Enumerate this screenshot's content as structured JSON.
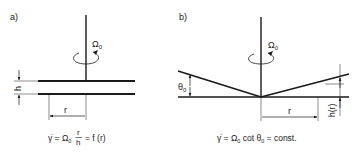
{
  "panel_a": {
    "label": "a)",
    "omega": "Ω",
    "omega_sub": "0",
    "h_label": "h",
    "r_label": "r",
    "formula": {
      "lhs": "γ̇ = Ω",
      "lhs_sub": "0",
      "frac_num": "r",
      "frac_den": "h",
      "rhs": "= f (r)"
    }
  },
  "panel_b": {
    "label": "b)",
    "omega": "Ω",
    "omega_sub": "0",
    "theta": "θ",
    "theta_sub": "0",
    "r_label": "r",
    "h_label": "h(r)",
    "formula": {
      "part1": "γ̇ = Ω",
      "sub1": "0",
      "part2": " cot θ",
      "sub2": "0",
      "part3": " = const."
    }
  },
  "colors": {
    "line": "#1a1a1a",
    "background": "#ffffff"
  }
}
